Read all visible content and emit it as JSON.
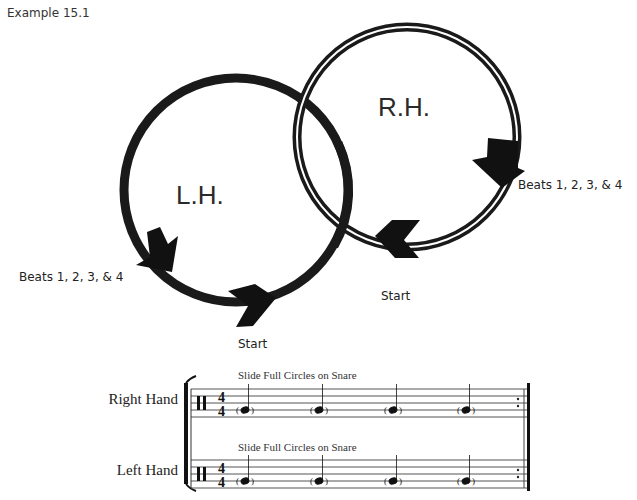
{
  "caption": "Example 15.1",
  "diagram": {
    "left_circle": {
      "label": "L.H.",
      "beats_label": "Beats 1, 2, 3, & 4",
      "start_label": "Start",
      "style": "solid thick ring",
      "direction": "counter-clockwise"
    },
    "right_circle": {
      "label": "R.H.",
      "beats_label": "Beats 1, 2, 3, & 4",
      "start_label": "Start",
      "style": "double-line ring",
      "direction": "clockwise"
    }
  },
  "notation": {
    "staves": [
      {
        "name": "Right Hand",
        "instruction": "Slide Full Circles on Snare",
        "clef": "percussion",
        "time_signature": {
          "top": "4",
          "bottom": "4"
        },
        "notes": [
          "(quarter)",
          "(quarter)",
          "(quarter)",
          "(quarter)"
        ],
        "end": "repeat"
      },
      {
        "name": "Left Hand",
        "instruction": "Slide Full Circles on Snare",
        "clef": "percussion",
        "time_signature": {
          "top": "4",
          "bottom": "4"
        },
        "notes": [
          "(quarter)",
          "(quarter)",
          "(quarter)",
          "(quarter)"
        ],
        "end": "repeat"
      }
    ]
  }
}
